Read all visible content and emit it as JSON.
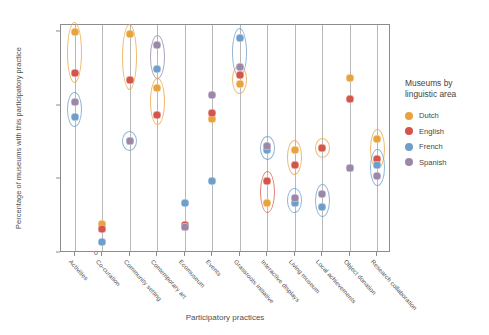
{
  "chart_data": {
    "type": "scatter",
    "title": "",
    "xlabel": "Participatory practices",
    "ylabel": "Percentage of museums with this participatory practice",
    "ylim": [
      0,
      62
    ],
    "yticks": [
      0,
      20,
      40,
      60
    ],
    "ytick_labels": [
      "0",
      "20",
      "40",
      "60"
    ],
    "grid": false,
    "legend_position": "right",
    "legend_title": "Museums by linguistic area",
    "categories": [
      "Activities",
      "Co-curation",
      "Community setting",
      "Contemporary art",
      "Ecomuseum",
      "Events",
      "Grassroots initiative",
      "Interactive displays",
      "Living museum",
      "Local achievements",
      "Object donation",
      "Research collaboration"
    ],
    "series": [
      {
        "name": "Dutch",
        "color": "#e8a33d",
        "values": [
          60.0,
          8.0,
          59.5,
          45.0,
          7.0,
          36.5,
          46.0,
          13.5,
          28.0,
          28.5,
          47.5,
          31.0
        ]
      },
      {
        "name": "English",
        "color": "#d4564a",
        "values": [
          49.0,
          6.5,
          47.0,
          37.5,
          7.5,
          38.0,
          48.5,
          19.5,
          24.0,
          28.5,
          42.0,
          25.5
        ]
      },
      {
        "name": "French",
        "color": "#6e9ec9",
        "values": [
          37.0,
          3.0,
          30.5,
          50.0,
          13.5,
          19.5,
          58.5,
          28.0,
          13.5,
          12.5,
          23.0,
          24.0
        ]
      },
      {
        "name": "Spanish",
        "color": "#9b88a8",
        "values": [
          41.0,
          null,
          30.5,
          56.5,
          7.0,
          43.0,
          50.5,
          29.0,
          15.0,
          16.0,
          23.0,
          21.0
        ]
      }
    ],
    "annotations_note": "Coloured ellipses surround groups of points that cluster together within a category."
  },
  "axes": {
    "y_title": "Percentage of museums with this participatory practice",
    "x_title": "Participatory practices",
    "y_ticks": [
      "60",
      "40",
      "20",
      "0"
    ]
  },
  "legend": {
    "title_line1": "Museums by",
    "title_line2": "linguistic area",
    "entries": [
      {
        "label": "Dutch",
        "color": "#e8a33d"
      },
      {
        "label": "English",
        "color": "#d4564a"
      },
      {
        "label": "French",
        "color": "#6e9ec9"
      },
      {
        "label": "Spanish",
        "color": "#9b88a8"
      }
    ]
  }
}
